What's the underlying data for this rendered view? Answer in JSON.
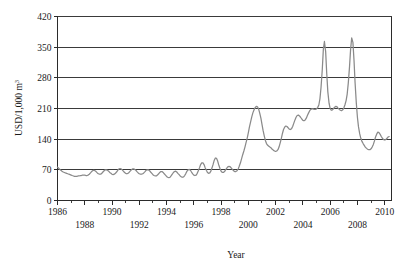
{
  "chart_data": {
    "type": "line",
    "title": "",
    "xlabel": "Year",
    "ylabel": "USD/1,000 m3",
    "ylabel_base": "USD/1,000 m",
    "ylabel_exponent": "3",
    "xlim": [
      1986,
      2010.5
    ],
    "ylim": [
      0,
      420
    ],
    "yticks": [
      0,
      70,
      140,
      210,
      280,
      350,
      420
    ],
    "ytick_labels": [
      "0",
      "70",
      "140",
      "210",
      "280",
      "350",
      "420"
    ],
    "grid": "horizontal",
    "legend": "none",
    "line_color": "#8a8a8a",
    "axis_color": "#2b2b2b",
    "xticks": [
      1986,
      1987,
      1988,
      1989,
      1990,
      1991,
      1992,
      1993,
      1994,
      1995,
      1996,
      1997,
      1998,
      1999,
      2000,
      2001,
      2002,
      2003,
      2004,
      2005,
      2006,
      2007,
      2008,
      2009,
      2010
    ],
    "xtick_labels_row1": [
      "1986",
      "1990",
      "1994",
      "1998",
      "2002",
      "2006",
      "2010"
    ],
    "xtick_labels_row2": [
      "1988",
      "1992",
      "1996",
      "2000",
      "2004",
      "2008"
    ],
    "xtick_row1_values": [
      1986,
      1990,
      1994,
      1998,
      2002,
      2006,
      2010
    ],
    "xtick_row2_values": [
      1988,
      1992,
      1996,
      2000,
      2004,
      2008
    ],
    "series": [
      {
        "name": "Price",
        "x": [
          1986.0,
          1986.08,
          1986.17,
          1986.25,
          1986.33,
          1986.42,
          1986.5,
          1986.58,
          1986.67,
          1986.75,
          1986.83,
          1986.92,
          1987.0,
          1987.08,
          1987.17,
          1987.25,
          1987.33,
          1987.42,
          1987.5,
          1987.58,
          1987.67,
          1987.75,
          1987.83,
          1987.92,
          1988.0,
          1988.08,
          1988.17,
          1988.25,
          1988.33,
          1988.42,
          1988.5,
          1988.58,
          1988.67,
          1988.75,
          1988.83,
          1988.92,
          1989.0,
          1989.08,
          1989.17,
          1989.25,
          1989.33,
          1989.42,
          1989.5,
          1989.58,
          1989.67,
          1989.75,
          1989.83,
          1989.92,
          1990.0,
          1990.08,
          1990.17,
          1990.25,
          1990.33,
          1990.42,
          1990.5,
          1990.58,
          1990.67,
          1990.75,
          1990.83,
          1990.92,
          1991.0,
          1991.08,
          1991.17,
          1991.25,
          1991.33,
          1991.42,
          1991.5,
          1991.58,
          1991.67,
          1991.75,
          1991.83,
          1991.92,
          1992.0,
          1992.08,
          1992.17,
          1992.25,
          1992.33,
          1992.42,
          1992.5,
          1992.58,
          1992.67,
          1992.75,
          1992.83,
          1992.92,
          1993.0,
          1993.08,
          1993.17,
          1993.25,
          1993.33,
          1993.42,
          1993.5,
          1993.58,
          1993.67,
          1993.75,
          1993.83,
          1993.92,
          1994.0,
          1994.08,
          1994.17,
          1994.25,
          1994.33,
          1994.42,
          1994.5,
          1994.58,
          1994.67,
          1994.75,
          1994.83,
          1994.92,
          1995.0,
          1995.08,
          1995.17,
          1995.25,
          1995.33,
          1995.42,
          1995.5,
          1995.58,
          1995.67,
          1995.75,
          1995.83,
          1995.92,
          1996.0,
          1996.08,
          1996.17,
          1996.25,
          1996.33,
          1996.42,
          1996.5,
          1996.58,
          1996.67,
          1996.75,
          1996.83,
          1996.92,
          1997.0,
          1997.08,
          1997.17,
          1997.25,
          1997.33,
          1997.42,
          1997.5,
          1997.58,
          1997.67,
          1997.75,
          1997.83,
          1997.92,
          1998.0,
          1998.08,
          1998.17,
          1998.25,
          1998.33,
          1998.42,
          1998.5,
          1998.58,
          1998.67,
          1998.75,
          1998.83,
          1998.92,
          1999.0,
          1999.08,
          1999.17,
          1999.25,
          1999.33,
          1999.42,
          1999.5,
          1999.58,
          1999.67,
          1999.75,
          1999.83,
          1999.92,
          2000.0,
          2000.08,
          2000.17,
          2000.25,
          2000.33,
          2000.42,
          2000.5,
          2000.58,
          2000.67,
          2000.75,
          2000.83,
          2000.92,
          2001.0,
          2001.08,
          2001.17,
          2001.25,
          2001.33,
          2001.42,
          2001.5,
          2001.58,
          2001.67,
          2001.75,
          2001.83,
          2001.92,
          2002.0,
          2002.08,
          2002.17,
          2002.25,
          2002.33,
          2002.42,
          2002.5,
          2002.58,
          2002.67,
          2002.75,
          2002.83,
          2002.92,
          2003.0,
          2003.08,
          2003.17,
          2003.25,
          2003.33,
          2003.42,
          2003.5,
          2003.58,
          2003.67,
          2003.75,
          2003.83,
          2003.92,
          2004.0,
          2004.08,
          2004.17,
          2004.25,
          2004.33,
          2004.42,
          2004.5,
          2004.58,
          2004.67,
          2004.75,
          2004.83,
          2004.92,
          2005.0,
          2005.08,
          2005.17,
          2005.25,
          2005.33,
          2005.42,
          2005.5,
          2005.58,
          2005.67,
          2005.75,
          2005.83,
          2005.92,
          2006.0,
          2006.08,
          2006.17,
          2006.25,
          2006.33,
          2006.42,
          2006.5,
          2006.58,
          2006.67,
          2006.75,
          2006.83,
          2006.92,
          2007.0,
          2007.08,
          2007.17,
          2007.25,
          2007.33,
          2007.42,
          2007.5,
          2007.58,
          2007.67,
          2007.75,
          2007.83,
          2007.92,
          2008.0,
          2008.08,
          2008.17,
          2008.25,
          2008.33,
          2008.42,
          2008.5,
          2008.58,
          2008.67,
          2008.75,
          2008.83,
          2008.92,
          2009.0,
          2009.08,
          2009.17,
          2009.25,
          2009.33,
          2009.42,
          2009.5,
          2009.58,
          2009.67,
          2009.75,
          2009.83,
          2009.92,
          2010.0,
          2010.08,
          2010.17,
          2010.25,
          2010.33
        ],
        "values": [
          76,
          74,
          71,
          69,
          67,
          65,
          64,
          63,
          62,
          61,
          60,
          59,
          58,
          57,
          56,
          55,
          55,
          55,
          56,
          56,
          57,
          57,
          58,
          58,
          58,
          57,
          57,
          58,
          60,
          63,
          66,
          68,
          69,
          68,
          66,
          63,
          61,
          60,
          60,
          62,
          65,
          68,
          70,
          70,
          69,
          67,
          64,
          62,
          60,
          59,
          60,
          62,
          65,
          69,
          72,
          73,
          72,
          70,
          67,
          64,
          62,
          61,
          62,
          64,
          67,
          70,
          72,
          72,
          71,
          69,
          66,
          63,
          61,
          60,
          60,
          61,
          63,
          66,
          69,
          70,
          70,
          68,
          65,
          62,
          59,
          57,
          56,
          56,
          58,
          61,
          64,
          66,
          66,
          64,
          61,
          58,
          55,
          53,
          52,
          53,
          56,
          60,
          64,
          66,
          67,
          65,
          62,
          59,
          56,
          54,
          53,
          54,
          57,
          62,
          67,
          70,
          71,
          69,
          65,
          61,
          58,
          57,
          58,
          62,
          68,
          75,
          82,
          86,
          86,
          82,
          75,
          69,
          64,
          62,
          63,
          67,
          74,
          83,
          92,
          97,
          96,
          90,
          81,
          73,
          67,
          64,
          64,
          66,
          70,
          74,
          77,
          78,
          77,
          74,
          71,
          68,
          66,
          66,
          68,
          72,
          78,
          86,
          95,
          104,
          113,
          122,
          132,
          143,
          155,
          168,
          180,
          191,
          200,
          207,
          212,
          215,
          214,
          209,
          200,
          188,
          174,
          160,
          147,
          137,
          130,
          126,
          124,
          122,
          120,
          117,
          115,
          113,
          112,
          113,
          116,
          122,
          131,
          142,
          153,
          162,
          168,
          170,
          169,
          166,
          163,
          162,
          164,
          169,
          176,
          184,
          190,
          194,
          195,
          193,
          190,
          186,
          183,
          182,
          184,
          188,
          194,
          200,
          205,
          208,
          209,
          209,
          208,
          208,
          209,
          212,
          218,
          232,
          258,
          298,
          345,
          363,
          340,
          290,
          248,
          222,
          210,
          206,
          207,
          210,
          213,
          215,
          214,
          211,
          208,
          206,
          205,
          207,
          211,
          218,
          228,
          243,
          268,
          305,
          345,
          371,
          361,
          320,
          268,
          222,
          190,
          168,
          152,
          142,
          135,
          130,
          126,
          122,
          119,
          117,
          116,
          116,
          118,
          122,
          128,
          136,
          145,
          152,
          156,
          155,
          151,
          146,
          142,
          139,
          138,
          139,
          142,
          145,
          146
        ]
      }
    ]
  }
}
